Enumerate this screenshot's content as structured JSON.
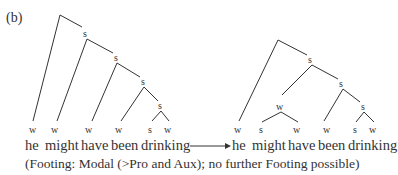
{
  "label": "(b)",
  "left_tree": {
    "nodes": [
      "S",
      "S",
      "S",
      "S"
    ],
    "leaves": [
      "W",
      "W",
      "W",
      "W",
      "S",
      "W"
    ],
    "words": [
      "he",
      "might",
      "have",
      "been",
      "drinking"
    ]
  },
  "arrow": "⟶",
  "right_tree": {
    "nodes": [
      "S",
      "S",
      "W",
      "S"
    ],
    "leaves": [
      "W",
      "S",
      "W",
      "W",
      "S",
      "W"
    ],
    "words": [
      "he",
      "might",
      "have",
      "been",
      "drinking"
    ]
  },
  "caption": "(Footing: Modal (>Pro and Aux); no further Footing possible)"
}
